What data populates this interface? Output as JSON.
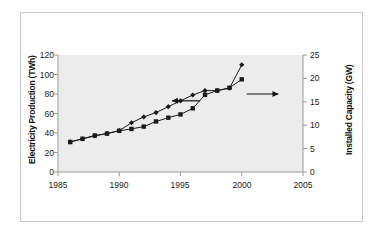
{
  "chart_data": {
    "type": "line",
    "title": "",
    "xlabel": "",
    "ylabel": "Electricity Production (TWh)",
    "ylabel_secondary": "Installed Capacity (GW)",
    "xlim": [
      1985,
      2005
    ],
    "ylim": [
      0,
      120
    ],
    "ylim_secondary": [
      0,
      25
    ],
    "xticks": [
      "1985",
      "1990",
      "1995",
      "2000",
      "2005"
    ],
    "xtick_values": [
      1985,
      1990,
      1995,
      2000,
      2005
    ],
    "yticks": [
      "0",
      "20",
      "40",
      "60",
      "80",
      "100",
      "120"
    ],
    "ytick_values": [
      0,
      20,
      40,
      60,
      80,
      100,
      120
    ],
    "yticks_secondary": [
      "0",
      "5",
      "10",
      "15",
      "20",
      "25"
    ],
    "ytick_values_secondary": [
      0,
      5,
      10,
      15,
      20,
      25
    ],
    "grid": false,
    "legend": "none",
    "plot_background": "#ececec",
    "series_color": "#1a1a1a",
    "x": [
      1986,
      1987,
      1988,
      1989,
      1990,
      1991,
      1992,
      1993,
      1994,
      1995,
      1996,
      1997,
      1998,
      1999,
      2000
    ],
    "series": [
      {
        "name": "Electricity Production (TWh)",
        "axis": "left",
        "marker": "diamond",
        "values": [
          31,
          34,
          37,
          39.5,
          42.5,
          50.5,
          56.5,
          61,
          67,
          73,
          79,
          83.5,
          83.5,
          86,
          110
        ]
      },
      {
        "name": "Installed Capacity (GW)",
        "axis": "right",
        "marker": "square",
        "values": [
          6.4,
          7.1,
          7.8,
          8.2,
          8.8,
          9.2,
          9.7,
          10.8,
          11.6,
          12.3,
          13.6,
          16.5,
          17.4,
          18.0,
          19.8
        ]
      }
    ],
    "annotations": [
      {
        "name": "left-arrow",
        "points_to": "Electricity Production (TWh)",
        "direction": "left",
        "x_from": 1996.6,
        "x_to": 1994.3,
        "y": 73
      },
      {
        "name": "right-arrow",
        "points_to": "Installed Capacity (GW)",
        "direction": "right",
        "x_from": 2000.4,
        "x_to": 2003.0,
        "y": 80
      }
    ]
  }
}
